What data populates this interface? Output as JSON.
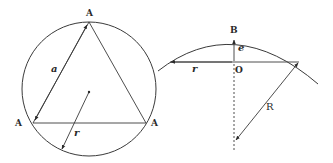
{
  "colors": {
    "stroke": "#3a3a3a",
    "background": "#ffffff"
  },
  "left_figure": {
    "description": "Equilateral triangle inscribed in a circle",
    "vertex_labels": [
      "A",
      "A",
      "A"
    ],
    "side_label": "a",
    "radius_label": "r"
  },
  "right_figure": {
    "description": "Arc of circle with sagitta",
    "top_label": "B",
    "center_label": "O",
    "sagitta_label": "e",
    "half_chord_label": "r",
    "radius_label": "R"
  }
}
